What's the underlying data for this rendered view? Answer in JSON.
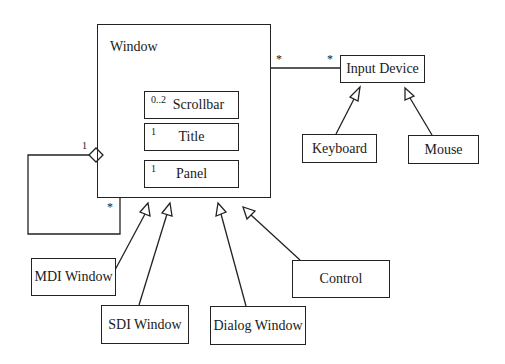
{
  "diagram": {
    "type": "UML class diagram",
    "classes": {
      "window": {
        "name": "Window"
      },
      "scrollbar": {
        "name": "Scrollbar",
        "multiplicity": "0..2"
      },
      "title": {
        "name": "Title",
        "multiplicity": "1"
      },
      "panel": {
        "name": "Panel",
        "multiplicity": "1"
      },
      "input_device": {
        "name": "Input Device"
      },
      "keyboard": {
        "name": "Keyboard"
      },
      "mouse": {
        "name": "Mouse"
      },
      "mdi_window": {
        "name": "MDI Window"
      },
      "sdi_window": {
        "name": "SDI Window"
      },
      "dialog_window": {
        "name": "Dialog Window"
      },
      "control": {
        "name": "Control"
      }
    },
    "relationships": {
      "window_input_device": {
        "type": "association",
        "source_mult": "*",
        "target_mult": "*"
      },
      "window_self_aggregation": {
        "type": "aggregation",
        "whole_mult": "1",
        "part_mult": "*"
      },
      "generalizations": [
        {
          "child": "Keyboard",
          "parent": "Input Device"
        },
        {
          "child": "Mouse",
          "parent": "Input Device"
        },
        {
          "child": "MDI Window",
          "parent": "Window"
        },
        {
          "child": "SDI Window",
          "parent": "Window"
        },
        {
          "child": "Dialog Window",
          "parent": "Window"
        },
        {
          "child": "Control",
          "parent": "Window"
        }
      ]
    }
  }
}
